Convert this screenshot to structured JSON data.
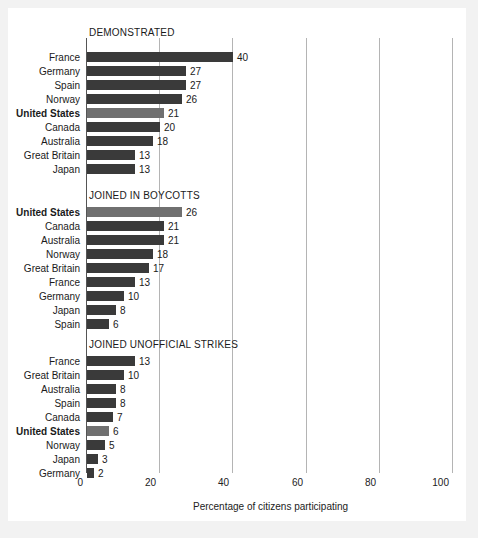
{
  "chart_data": {
    "type": "bar",
    "title": "",
    "xlabel": "Percentage of citizens participating",
    "ylabel": "",
    "xlim": [
      0,
      100
    ],
    "xticks": [
      0,
      20,
      40,
      60,
      80,
      100
    ],
    "xtick_labels": [
      "0",
      "20",
      "40",
      "60",
      "80",
      "100"
    ],
    "grid": true,
    "legend": "none",
    "orientation": "horizontal",
    "highlight_category": "United States",
    "highlight_color": "#707070",
    "bar_color": "#3a3a3a",
    "panels": [
      {
        "title": "DEMONSTRATED",
        "categories": [
          "France",
          "Germany",
          "Spain",
          "Norway",
          "United States",
          "Canada",
          "Australia",
          "Great Britain",
          "Japan"
        ],
        "values": [
          40,
          27,
          27,
          26,
          21,
          20,
          18,
          13,
          13
        ],
        "highlighted": [
          false,
          false,
          false,
          false,
          true,
          false,
          false,
          false,
          false
        ]
      },
      {
        "title": "JOINED IN BOYCOTTS",
        "categories": [
          "United States",
          "Canada",
          "Australia",
          "Norway",
          "Great Britain",
          "France",
          "Germany",
          "Japan",
          "Spain"
        ],
        "values": [
          26,
          21,
          21,
          18,
          17,
          13,
          10,
          8,
          6
        ],
        "highlighted": [
          true,
          false,
          false,
          false,
          false,
          false,
          false,
          false,
          false
        ]
      },
      {
        "title": "JOINED UNOFFICIAL STRIKES",
        "categories": [
          "France",
          "Great Britain",
          "Australia",
          "Spain",
          "Canada",
          "United States",
          "Norway",
          "Japan",
          "Germany"
        ],
        "values": [
          13,
          10,
          8,
          8,
          7,
          6,
          5,
          3,
          2
        ],
        "highlighted": [
          false,
          false,
          false,
          false,
          false,
          true,
          false,
          false,
          false
        ]
      }
    ]
  }
}
